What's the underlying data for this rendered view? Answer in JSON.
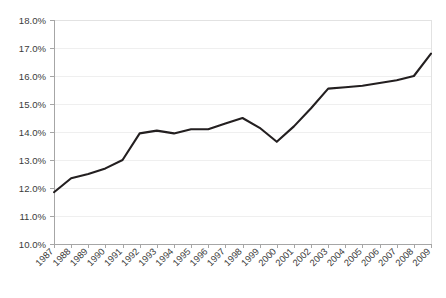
{
  "chart_data": {
    "type": "line",
    "title": "",
    "subtitle": "",
    "xlabel": "",
    "ylabel": "",
    "grid": true,
    "legend": false,
    "legend_position": "none",
    "line_color": "#231f20",
    "grid_color": "#efefef",
    "axis_color": "#a6a6a6",
    "text_color": "#3b3b3b",
    "xlim": [
      1987,
      2009
    ],
    "ylim": [
      10.0,
      18.0
    ],
    "y_tick_step": 1.0,
    "x_tick_rotation": -45,
    "categories": [
      "1987",
      "1988",
      "1989",
      "1990",
      "1991",
      "1992",
      "1993",
      "1994",
      "1995",
      "1996",
      "1997",
      "1998",
      "1999",
      "2000",
      "2001",
      "2002",
      "2003",
      "2004",
      "2005",
      "2006",
      "2007",
      "2008",
      "2009"
    ],
    "values": [
      11.85,
      12.35,
      12.5,
      12.7,
      13.0,
      13.95,
      14.05,
      13.95,
      14.1,
      14.1,
      14.3,
      14.5,
      14.15,
      13.65,
      14.2,
      14.85,
      15.55,
      15.6,
      15.65,
      15.75,
      15.85,
      16.0,
      16.8
    ],
    "y_ticks": [
      "10.0%",
      "11.0%",
      "12.0%",
      "13.0%",
      "14.0%",
      "15.0%",
      "16.0%",
      "17.0%",
      "18.0%"
    ],
    "y_tick_values": [
      10.0,
      11.0,
      12.0,
      13.0,
      14.0,
      15.0,
      16.0,
      17.0,
      18.0
    ],
    "series": [
      {
        "name": "series-1",
        "values": [
          11.85,
          12.35,
          12.5,
          12.7,
          13.0,
          13.95,
          14.05,
          13.95,
          14.1,
          14.1,
          14.3,
          14.5,
          14.15,
          13.65,
          14.2,
          14.85,
          15.55,
          15.6,
          15.65,
          15.75,
          15.85,
          16.0,
          16.8
        ]
      }
    ]
  }
}
